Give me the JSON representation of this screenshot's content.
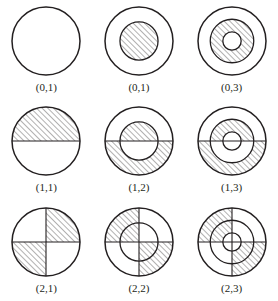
{
  "figure": {
    "type": "diagram-grid",
    "rows": 3,
    "columns": 3,
    "stroke_color": "#231f20",
    "hatch_color": "#231f20",
    "fill_color": "#ffffff",
    "cells": [
      {
        "label": "(0,1)",
        "name": "figure-0-1",
        "rings": 1,
        "sectors": 1,
        "hatched_regions": []
      },
      {
        "label": "(0,1)",
        "name": "figure-0-1-b",
        "rings": 2,
        "sectors": 1,
        "hatched_regions": [
          {
            "ring": 0,
            "sector": 0
          }
        ]
      },
      {
        "label": "(0,3)",
        "name": "figure-0-3",
        "rings": 3,
        "sectors": 1,
        "hatched_regions": [
          {
            "ring": 1,
            "sector": 0
          }
        ]
      },
      {
        "label": "(1,1)",
        "name": "figure-1-1",
        "rings": 1,
        "sectors": 2,
        "hatched_regions": [
          {
            "ring": 0,
            "sector": 0
          }
        ]
      },
      {
        "label": "(1,2)",
        "name": "figure-1-2",
        "rings": 2,
        "sectors": 2,
        "hatched_regions": [
          {
            "ring": 0,
            "sector": 0
          },
          {
            "ring": 1,
            "sector": 1
          }
        ]
      },
      {
        "label": "(1,3)",
        "name": "figure-1-3",
        "rings": 3,
        "sectors": 2,
        "hatched_regions": [
          {
            "ring": 1,
            "sector": 0
          },
          {
            "ring": 2,
            "sector": 1
          }
        ]
      },
      {
        "label": "(2,1)",
        "name": "figure-2-1",
        "rings": 1,
        "sectors": 4,
        "hatched_regions": [
          {
            "ring": 0,
            "sector": 1
          },
          {
            "ring": 0,
            "sector": 3
          }
        ]
      },
      {
        "label": "(2,2)",
        "name": "figure-2-2",
        "rings": 2,
        "sectors": 4,
        "hatched_regions": [
          {
            "ring": 0,
            "sector": 0
          },
          {
            "ring": 0,
            "sector": 2
          },
          {
            "ring": 1,
            "sector": 0
          },
          {
            "ring": 1,
            "sector": 2
          }
        ]
      },
      {
        "label": "(2,3)",
        "name": "figure-2-3",
        "rings": 3,
        "sectors": 4,
        "hatched_regions": [
          {
            "ring": 1,
            "sector": 0
          },
          {
            "ring": 1,
            "sector": 2
          },
          {
            "ring": 2,
            "sector": 0
          },
          {
            "ring": 2,
            "sector": 2
          }
        ]
      }
    ]
  }
}
